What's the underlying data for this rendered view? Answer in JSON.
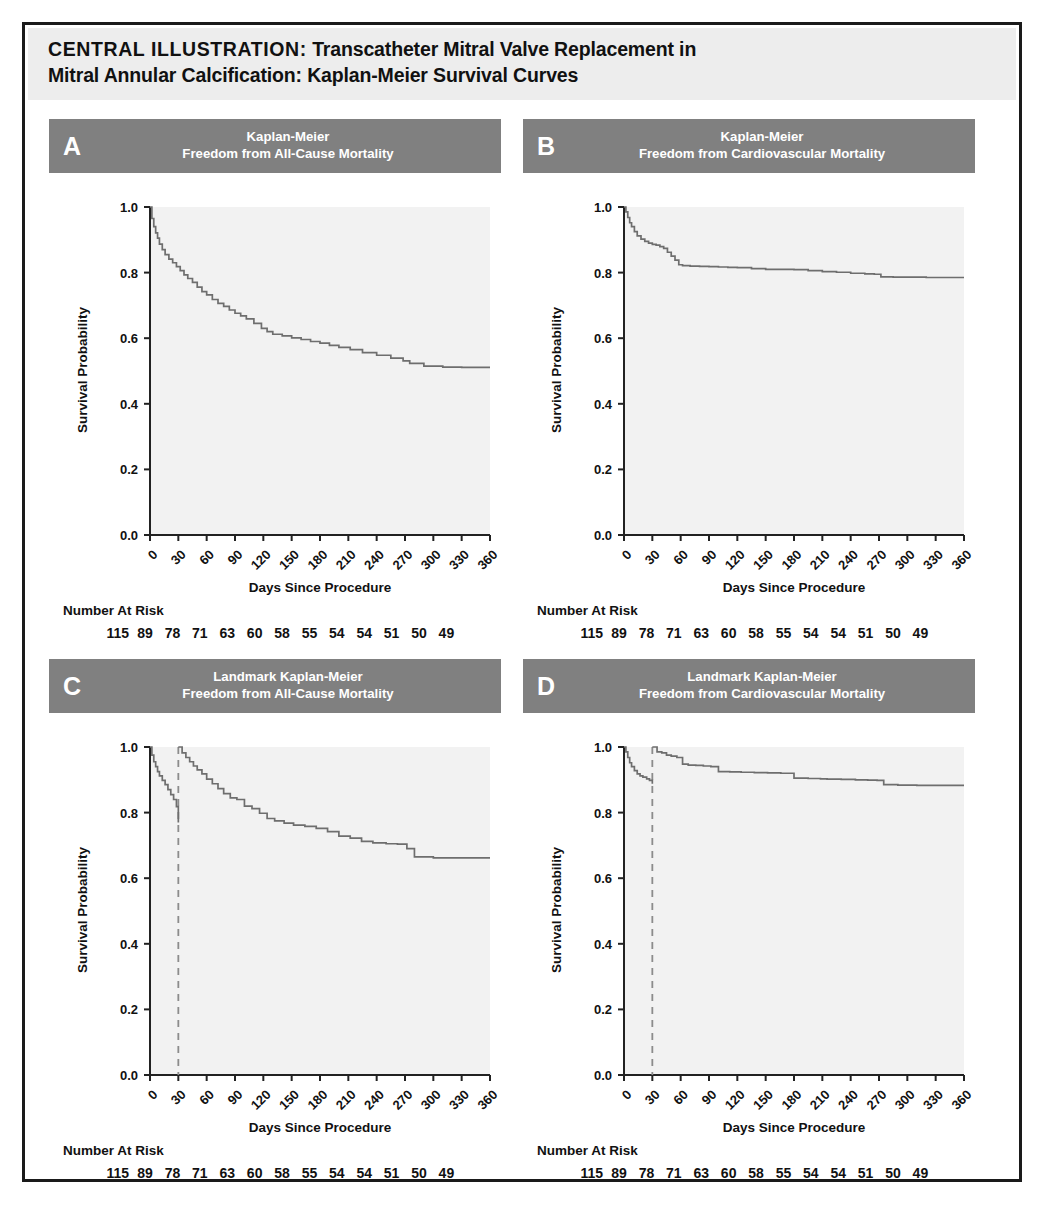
{
  "figure": {
    "title_lead": "CENTRAL ILLUSTRATION:",
    "title_rest": " Transcatheter Mitral Valve Replacement in",
    "title_line2": "Mitral Annular Calcification: Kaplan-Meier Survival Curves",
    "frame_color": "#1a1a1a",
    "title_band_color": "#ededed",
    "panel_header_color": "#808080",
    "plot_bg_color": "#f2f2f2",
    "curve_color": "#6e6e6e",
    "landmark_line_color": "#8c8c8c"
  },
  "common": {
    "xlabel": "Days Since Procedure",
    "ylabel": "Survival Probability",
    "risk_label": "Number At Risk",
    "xticks": [
      0,
      30,
      60,
      90,
      120,
      150,
      180,
      210,
      240,
      270,
      300,
      330,
      360
    ],
    "xtick_labels": [
      "0",
      "30",
      "60",
      "90",
      "120",
      "150",
      "180",
      "210",
      "240",
      "270",
      "300",
      "330",
      "360"
    ],
    "yticks": [
      0.0,
      0.2,
      0.4,
      0.6,
      0.8,
      1.0
    ],
    "ytick_labels": [
      "0.0",
      "0.2",
      "0.4",
      "0.6",
      "0.8",
      "1.0"
    ],
    "numbers_at_risk": [
      "115",
      "89",
      "78",
      "71",
      "63",
      "60",
      "58",
      "55",
      "54",
      "54",
      "51",
      "50",
      "49"
    ]
  },
  "chart_data": [
    {
      "type": "line",
      "panel": "A",
      "letter": "A",
      "title_line1": "Kaplan-Meier",
      "title_line2": "Freedom from All-Cause Mortality",
      "title": "Kaplan-Meier Freedom from All-Cause Mortality",
      "xlabel": "Days Since Procedure",
      "ylabel": "Survival Probability",
      "xlim": [
        0,
        360
      ],
      "ylim": [
        0.0,
        1.0
      ],
      "grid": false,
      "legend": "none",
      "step": true,
      "landmark_day": null,
      "numbers_at_risk": [
        "115",
        "89",
        "78",
        "71",
        "63",
        "60",
        "58",
        "55",
        "54",
        "54",
        "51",
        "50",
        "49"
      ],
      "x": [
        0,
        2,
        4,
        6,
        8,
        10,
        13,
        16,
        20,
        24,
        28,
        32,
        36,
        40,
        45,
        50,
        55,
        60,
        66,
        72,
        78,
        84,
        90,
        96,
        102,
        110,
        118,
        124,
        130,
        140,
        150,
        160,
        170,
        180,
        190,
        200,
        212,
        225,
        240,
        255,
        268,
        275,
        290,
        310,
        330,
        345,
        360
      ],
      "y": [
        1.0,
        0.965,
        0.94,
        0.921,
        0.905,
        0.887,
        0.87,
        0.855,
        0.841,
        0.83,
        0.818,
        0.806,
        0.793,
        0.782,
        0.77,
        0.756,
        0.742,
        0.732,
        0.718,
        0.706,
        0.697,
        0.686,
        0.676,
        0.668,
        0.659,
        0.645,
        0.63,
        0.62,
        0.612,
        0.607,
        0.601,
        0.596,
        0.59,
        0.585,
        0.578,
        0.572,
        0.565,
        0.556,
        0.548,
        0.539,
        0.531,
        0.523,
        0.515,
        0.512,
        0.511,
        0.511,
        0.511
      ]
    },
    {
      "type": "line",
      "panel": "B",
      "letter": "B",
      "title_line1": "Kaplan-Meier",
      "title_line2": "Freedom from Cardiovascular Mortality",
      "title": "Kaplan-Meier Freedom from Cardiovascular Mortality",
      "xlabel": "Days Since Procedure",
      "ylabel": "Survival Probability",
      "xlim": [
        0,
        360
      ],
      "ylim": [
        0.0,
        1.0
      ],
      "grid": false,
      "legend": "none",
      "step": true,
      "landmark_day": null,
      "numbers_at_risk": [
        "115",
        "89",
        "78",
        "71",
        "63",
        "60",
        "58",
        "55",
        "54",
        "54",
        "51",
        "50",
        "49"
      ],
      "x": [
        0,
        2,
        4,
        6,
        8,
        11,
        14,
        18,
        22,
        26,
        30,
        34,
        38,
        42,
        46,
        50,
        54,
        58,
        62,
        70,
        80,
        90,
        100,
        110,
        120,
        135,
        150,
        165,
        180,
        195,
        210,
        225,
        240,
        255,
        265,
        272,
        285,
        300,
        320,
        340,
        360
      ],
      "y": [
        1.0,
        0.985,
        0.968,
        0.952,
        0.94,
        0.925,
        0.912,
        0.902,
        0.895,
        0.89,
        0.886,
        0.884,
        0.879,
        0.874,
        0.862,
        0.85,
        0.838,
        0.824,
        0.821,
        0.82,
        0.819,
        0.818,
        0.817,
        0.816,
        0.815,
        0.812,
        0.81,
        0.81,
        0.809,
        0.806,
        0.803,
        0.801,
        0.798,
        0.796,
        0.795,
        0.787,
        0.786,
        0.786,
        0.785,
        0.785,
        0.785
      ]
    },
    {
      "type": "line",
      "panel": "C",
      "letter": "C",
      "title_line1": "Landmark Kaplan-Meier",
      "title_line2": "Freedom from All-Cause Mortality",
      "title": "Landmark Kaplan-Meier Freedom from All-Cause Mortality",
      "xlabel": "Days Since Procedure",
      "ylabel": "Survival Probability",
      "xlim": [
        0,
        360
      ],
      "ylim": [
        0.0,
        1.0
      ],
      "grid": false,
      "legend": "none",
      "step": true,
      "landmark_day": 30,
      "numbers_at_risk": [
        "115",
        "89",
        "78",
        "71",
        "63",
        "60",
        "58",
        "55",
        "54",
        "54",
        "51",
        "50",
        "49"
      ],
      "segments": [
        {
          "name": "pre-landmark",
          "x": [
            0,
            2,
            4,
            6,
            8,
            10,
            13,
            16,
            19,
            22,
            25,
            28,
            30
          ],
          "y": [
            1.0,
            0.975,
            0.955,
            0.94,
            0.925,
            0.912,
            0.898,
            0.885,
            0.87,
            0.855,
            0.84,
            0.818,
            0.77
          ]
        },
        {
          "name": "post-landmark",
          "x": [
            30,
            34,
            38,
            42,
            46,
            50,
            55,
            60,
            66,
            72,
            78,
            85,
            92,
            100,
            108,
            116,
            124,
            132,
            142,
            152,
            164,
            176,
            188,
            200,
            212,
            224,
            236,
            250,
            262,
            272,
            280,
            300,
            320,
            340,
            360
          ],
          "y": [
            1.0,
            0.982,
            0.968,
            0.955,
            0.942,
            0.93,
            0.918,
            0.902,
            0.888,
            0.873,
            0.858,
            0.845,
            0.84,
            0.82,
            0.812,
            0.798,
            0.782,
            0.775,
            0.768,
            0.762,
            0.758,
            0.752,
            0.742,
            0.728,
            0.722,
            0.712,
            0.708,
            0.705,
            0.704,
            0.69,
            0.665,
            0.662,
            0.662,
            0.662,
            0.662
          ]
        }
      ]
    },
    {
      "type": "line",
      "panel": "D",
      "letter": "D",
      "title_line1": "Landmark Kaplan-Meier",
      "title_line2": "Freedom from Cardiovascular Mortality",
      "title": "Landmark Kaplan-Meier Freedom from Cardiovascular Mortality",
      "xlabel": "Days Since Procedure",
      "ylabel": "Survival Probability",
      "xlim": [
        0,
        360
      ],
      "ylim": [
        0.0,
        1.0
      ],
      "grid": false,
      "legend": "none",
      "step": true,
      "landmark_day": 30,
      "numbers_at_risk": [
        "115",
        "89",
        "78",
        "71",
        "63",
        "60",
        "58",
        "55",
        "54",
        "54",
        "51",
        "50",
        "49"
      ],
      "segments": [
        {
          "name": "pre-landmark",
          "x": [
            0,
            2,
            4,
            6,
            8,
            11,
            14,
            17,
            20,
            24,
            27,
            30
          ],
          "y": [
            1.0,
            0.985,
            0.968,
            0.952,
            0.94,
            0.928,
            0.918,
            0.912,
            0.908,
            0.903,
            0.898,
            0.888
          ]
        },
        {
          "name": "post-landmark",
          "x": [
            30,
            35,
            40,
            45,
            50,
            56,
            62,
            68,
            76,
            84,
            92,
            100,
            112,
            124,
            138,
            152,
            166,
            180,
            195,
            208,
            215,
            230,
            245,
            258,
            268,
            275,
            290,
            310,
            330,
            345,
            360
          ],
          "y": [
            1.0,
            0.985,
            0.982,
            0.975,
            0.972,
            0.968,
            0.948,
            0.945,
            0.944,
            0.942,
            0.94,
            0.925,
            0.924,
            0.923,
            0.922,
            0.921,
            0.92,
            0.905,
            0.904,
            0.903,
            0.902,
            0.901,
            0.9,
            0.899,
            0.898,
            0.885,
            0.884,
            0.883,
            0.883,
            0.883,
            0.883
          ]
        }
      ]
    }
  ]
}
